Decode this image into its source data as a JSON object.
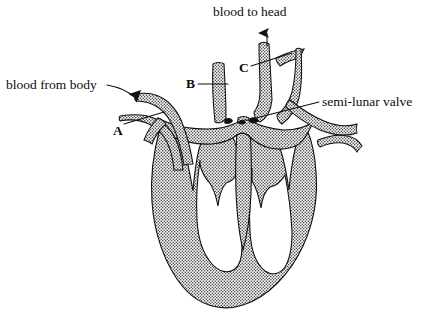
{
  "figure": {
    "title": "blood to head",
    "background_color": "#ffffff",
    "ink_color": "#111111",
    "wall_fill_color": "#9a9a9a",
    "wall_stipple_color": "#2b2b2b"
  },
  "labels": {
    "blood_to_head": "blood to head",
    "blood_from_body": "blood from body",
    "semi_lunar_valve": "semi-lunar valve",
    "letter_a": "A",
    "letter_b": "B",
    "letter_c": "C"
  },
  "annotations": [
    {
      "name": "blood-to-head",
      "text": "blood to head",
      "position": {
        "x": 213,
        "y": 5
      },
      "pointer": "arrowhead",
      "arrow_direction": "up",
      "arrow_tip": {
        "x": 268,
        "y": 25
      },
      "points_at": "aorta-outflow-vessel"
    },
    {
      "name": "blood-from-body",
      "text": "blood from body",
      "position": {
        "x": 6,
        "y": 78
      },
      "pointer": "curved-leader-with-arrowhead",
      "arrow_direction": "down-right",
      "arrow_tip": {
        "x": 139,
        "y": 103
      },
      "points_at": "vena-cava-inflow-vessel"
    },
    {
      "name": "semi-lunar-valve",
      "text": "semi-lunar valve",
      "position": {
        "x": 322,
        "y": 95
      },
      "pointer": "straight-leader",
      "leader_from": {
        "x": 318,
        "y": 103
      },
      "leader_to": {
        "x": 252,
        "y": 120
      },
      "points_at": "semi-lunar-valve-cusp"
    },
    {
      "name": "label-a",
      "text": "A",
      "position": {
        "x": 113,
        "y": 124
      },
      "pointer": "straight-leader",
      "leader_from": {
        "x": 124,
        "y": 125
      },
      "leader_to": {
        "x": 163,
        "y": 113
      },
      "points_at": "left-inflow-vessel"
    },
    {
      "name": "label-b",
      "text": "B",
      "position": {
        "x": 186,
        "y": 77
      },
      "pointer": "straight-leader",
      "leader_from": {
        "x": 197,
        "y": 84
      },
      "leader_to": {
        "x": 228,
        "y": 84
      },
      "points_at": "central-left-vessel"
    },
    {
      "name": "label-c",
      "text": "C",
      "position": {
        "x": 239,
        "y": 61
      },
      "pointer": "straight-leader",
      "leader_from": {
        "x": 250,
        "y": 66
      },
      "leader_to": {
        "x": 292,
        "y": 53
      },
      "points_at": "aorta-vessel"
    }
  ]
}
